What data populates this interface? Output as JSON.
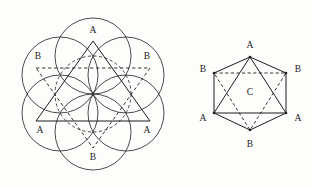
{
  "figure": {
    "background_color": "#fdfdfc",
    "stroke_color": "#1d1d1d",
    "label_color": "#1a1a1a"
  },
  "left_figure": {
    "name": "seven-circle-hexagonal-packing",
    "circle_radius": 38,
    "center": {
      "x": 93,
      "y": 94
    },
    "circles": [
      {
        "id": "c-top",
        "label": "A",
        "cx": 93,
        "cy": 56,
        "style": "solid",
        "label_x": 93,
        "label_y": 31
      },
      {
        "id": "c-upper-left",
        "label": "B",
        "cx": 60,
        "cy": 75,
        "style": "solid",
        "label_x": 38,
        "label_y": 57
      },
      {
        "id": "c-upper-right",
        "label": "B",
        "cx": 126,
        "cy": 75,
        "style": "solid",
        "label_x": 147,
        "label_y": 57
      },
      {
        "id": "c-lower-left",
        "label": "A",
        "cx": 60,
        "cy": 113,
        "style": "solid",
        "label_x": 40,
        "label_y": 131
      },
      {
        "id": "c-lower-right",
        "label": "A",
        "cx": 126,
        "cy": 113,
        "style": "solid",
        "label_x": 147,
        "label_y": 131
      },
      {
        "id": "c-bottom",
        "label": "B",
        "cx": 93,
        "cy": 132,
        "style": "solid",
        "label_x": 93,
        "label_y": 158
      },
      {
        "id": "c-center",
        "label": "",
        "cx": 93,
        "cy": 94,
        "style": "dashed",
        "label_x": 0,
        "label_y": 0
      }
    ],
    "solid_triangle": {
      "id": "upright-triangle",
      "points": "93,41 150,121 36,121"
    },
    "dashed_triangle": {
      "id": "inverted-triangle",
      "points": "36,68 150,68 93,148"
    }
  },
  "right_figure": {
    "name": "labelled-hexagon",
    "center": {
      "x": 250,
      "y": 93
    },
    "hexagon_outline": "250,57 286,73 286,113 250,130 214,113 214,73",
    "vertices": [
      {
        "id": "v-top",
        "label": "A",
        "x": 250,
        "y": 57,
        "label_x": 250,
        "label_y": 46
      },
      {
        "id": "v-upper-right",
        "label": "B",
        "x": 286,
        "y": 73,
        "label_x": 298,
        "label_y": 70
      },
      {
        "id": "v-lower-right",
        "label": "A",
        "x": 286,
        "y": 113,
        "label_x": 298,
        "label_y": 119
      },
      {
        "id": "v-bottom",
        "label": "B",
        "x": 250,
        "y": 130,
        "label_x": 250,
        "label_y": 145
      },
      {
        "id": "v-lower-left",
        "label": "A",
        "x": 214,
        "y": 113,
        "label_x": 203,
        "label_y": 119
      },
      {
        "id": "v-upper-left",
        "label": "B",
        "x": 214,
        "y": 73,
        "label_x": 203,
        "label_y": 70
      }
    ],
    "center_label": {
      "id": "center-c",
      "label": "C",
      "x": 250,
      "y": 93
    },
    "solid_triangle": {
      "id": "triangle-aaa",
      "points": "250,57 286,113 214,113"
    },
    "dashed_triangle": {
      "id": "triangle-bbb",
      "points": "214,73 286,73 250,130"
    }
  }
}
